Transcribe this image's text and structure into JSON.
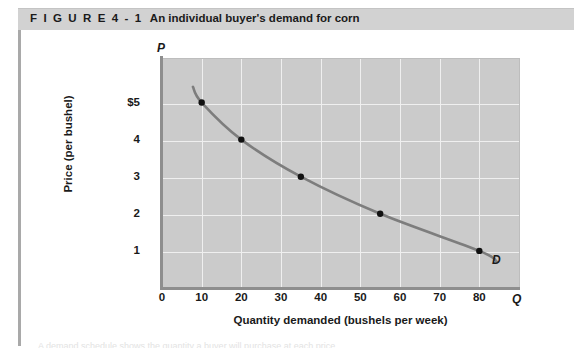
{
  "figure": {
    "number_label": "F I G U R E   4 - 1",
    "title": "An individual buyer's demand for corn",
    "header_bg": "#d2d2d2"
  },
  "chart_data": {
    "type": "line",
    "title": "An individual buyer's demand for corn",
    "xlabel": "Quantity demanded (bushels per week)",
    "ylabel": "Price (per bushel)",
    "x_axis_symbol": "Q",
    "y_axis_symbol": "P",
    "xlim": [
      0,
      90
    ],
    "ylim": [
      0,
      6.2
    ],
    "grid": true,
    "legend_position": "none",
    "xticks": [
      0,
      10,
      20,
      30,
      40,
      50,
      60,
      70,
      80
    ],
    "xtick_labels": [
      "0",
      "10",
      "20",
      "30",
      "40",
      "50",
      "60",
      "70",
      "80"
    ],
    "yticks": [
      1,
      2,
      3,
      4,
      5
    ],
    "ytick_labels": [
      "1",
      "2",
      "3",
      "4",
      "$5"
    ],
    "series": [
      {
        "name": "D",
        "label": "D",
        "color": "#7d7d7d",
        "marker": "filled-circle",
        "marker_color": "#111111",
        "x": [
          10,
          20,
          35,
          55,
          80
        ],
        "y": [
          5,
          4,
          3,
          2,
          1
        ]
      }
    ],
    "annotations": [
      {
        "text": "D",
        "x": 86,
        "y": 0.82
      }
    ],
    "plot_bg": "#cbcbcb",
    "gridline_color": "#efefef",
    "axis_color": "#8e8e8e"
  },
  "caption": {
    "sliver_text": "A demand schedule shows the quantity a buyer will purchase at each price."
  }
}
